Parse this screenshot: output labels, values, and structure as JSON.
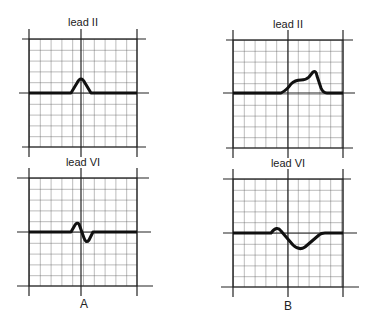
{
  "figure": {
    "columns": [
      {
        "caption": "A",
        "top_lead": "lead II",
        "bottom_lead": "lead VI"
      },
      {
        "caption": "B",
        "top_lead": "lead II",
        "bottom_lead": "lead VI"
      }
    ]
  },
  "colors": {
    "grid": "#333333",
    "trace": "#111111",
    "background": "#ffffff"
  }
}
